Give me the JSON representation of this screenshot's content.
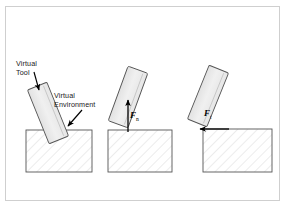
{
  "figure": {
    "background_color": "#ffffff",
    "frame_color": "#cfcfcf",
    "panel_count": 3
  },
  "style": {
    "tool_fill": "#ebebeb",
    "tool_stroke": "#555555",
    "environment_stroke": "#555555",
    "hatch_color": "#d9d9d9",
    "arrow_color": "#000000",
    "leader_color": "#000000",
    "text_color": "#1a1a1a"
  },
  "labels": {
    "virtual_tool": {
      "line1": "Virtual",
      "line2": "Tool"
    },
    "virtual_environment": {
      "line1": "Virtual",
      "line2": "Environment"
    }
  },
  "panels": [
    {
      "id": "panel-penetration",
      "description": "Virtual tool penetrating the virtual environment",
      "tool": {
        "angle_deg": -22,
        "center_x": 48,
        "center_y": 113,
        "width": 21,
        "height": 58
      },
      "environment": {
        "x": 26,
        "y": 130,
        "width": 66,
        "height": 42
      },
      "force": null
    },
    {
      "id": "panel-normal-force",
      "description": "Virtual tool on surface with vertical reaction force",
      "tool": {
        "angle_deg": 20,
        "center_x": 128,
        "center_y": 97,
        "width": 21,
        "height": 58
      },
      "environment": {
        "x": 108,
        "y": 130,
        "width": 64,
        "height": 42
      },
      "force": {
        "symbol": "F",
        "subscript": "n",
        "direction": "up",
        "label_x": 130,
        "label_y": 110
      }
    },
    {
      "id": "panel-tangential-force",
      "description": "Virtual tool at edge with horizontal reaction force",
      "tool": {
        "angle_deg": 22,
        "center_x": 208,
        "center_y": 96,
        "width": 21,
        "height": 58
      },
      "environment": {
        "x": 203,
        "y": 129,
        "width": 69,
        "height": 43
      },
      "force": {
        "symbol": "F",
        "subscript": "t",
        "direction": "left",
        "label_x": 204,
        "label_y": 108
      }
    }
  ]
}
